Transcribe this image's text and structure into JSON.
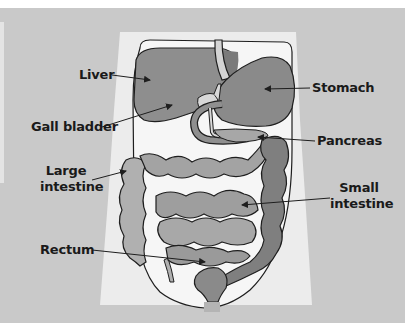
{
  "diagram": {
    "colors": {
      "background": "#ffffff",
      "panel": "#c9c9c9",
      "body_silhouette": "#ececec",
      "abdomen_cavity": "#f6f6f6",
      "liver": "#8e8e8e",
      "stomach": "#8a8a8a",
      "gall_bladder": "#d8d8d8",
      "duodenum": "#8f8f8f",
      "pancreas": "#a7a7a7",
      "small_intestine": "#9e9e9e",
      "large_intestine_ascending": "#b0b0b0",
      "large_intestine_descending": "#7f7f7f",
      "rectum": "#8a8a8a",
      "outline": "#1e1e1e",
      "label_text": "#1a1a1a"
    },
    "labels": {
      "liver": "Liver",
      "gall_bladder": "Gall bladder",
      "large_intestine_line1": "Large",
      "large_intestine_line2": "intestine",
      "rectum": "Rectum",
      "stomach": "Stomach",
      "pancreas": "Pancreas",
      "small_intestine_line1": "Small",
      "small_intestine_line2": "intestine"
    }
  }
}
